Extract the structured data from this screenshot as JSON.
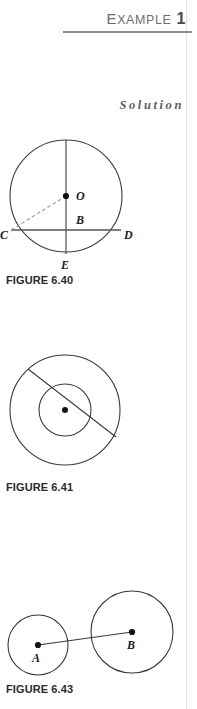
{
  "page": {
    "width": 197,
    "height": 709,
    "background": "#ffffff",
    "margin_rule_color": "#e2e2e2"
  },
  "header": {
    "label_first_letter": "E",
    "label_rest": "XAMPLE",
    "number": "1",
    "full_label": "EXAMPLE 1",
    "rule_color": "#8c8c8c",
    "text_color": "#6e6e6e"
  },
  "solution": {
    "label": "Solution",
    "color": "#5d5d5d"
  },
  "figures": [
    {
      "id": "figure-640",
      "caption": "FIGURE 6.40",
      "description": "Circle with center O, vertical diameter to E, horizontal chord C D through B, dashed radius from O to C",
      "stroke_color": "#3a3a3a",
      "dashed_color": "#9a9a9a",
      "chord_color": "#555555",
      "circle": {
        "cx": 66,
        "cy": 66,
        "r": 56
      },
      "points": [
        {
          "name": "O",
          "label": "O",
          "x": 66,
          "y": 66,
          "label_x": 76,
          "label_y": 70,
          "dot": true
        },
        {
          "name": "B",
          "label": "B",
          "x": 66,
          "y": 100,
          "label_x": 76,
          "label_y": 104,
          "dot": false
        },
        {
          "name": "C",
          "label": "C",
          "x": 11,
          "y": 100,
          "label_x": 1,
          "label_y": 110,
          "dot": false
        },
        {
          "name": "D",
          "label": "D",
          "x": 121,
          "y": 100,
          "label_x": 124,
          "label_y": 110,
          "dot": false
        },
        {
          "name": "E",
          "label": "E",
          "x": 66,
          "y": 124,
          "label_x": 61,
          "label_y": 138,
          "dot": false
        }
      ]
    },
    {
      "id": "figure-641",
      "caption": "FIGURE 6.41",
      "description": "Two concentric circles with a chord of the outer circle tangent to the inner circle",
      "stroke_color": "#3a3a3a",
      "outer_circle": {
        "cx": 65,
        "cy": 70,
        "r": 55
      },
      "inner_circle": {
        "cx": 65,
        "cy": 70,
        "r": 26
      },
      "center_dot": {
        "cx": 65,
        "cy": 70,
        "r": 3
      },
      "chord": {
        "x1": 28,
        "y1": 29,
        "x2": 116,
        "y2": 97
      }
    },
    {
      "id": "figure-643",
      "caption": "FIGURE 6.43",
      "description": "Two circles of different radii, centers A and B, joined by a line segment",
      "stroke_color": "#3a3a3a",
      "circle_a": {
        "cx": 38,
        "cy": 65,
        "r": 30,
        "label": "A",
        "label_x": 33,
        "label_y": 80
      },
      "circle_b": {
        "cx": 132,
        "cy": 52,
        "r": 41,
        "label": "B",
        "label_x": 128,
        "label_y": 68
      },
      "segment": {
        "x1": 38,
        "y1": 65,
        "x2": 132,
        "y2": 52
      }
    }
  ]
}
